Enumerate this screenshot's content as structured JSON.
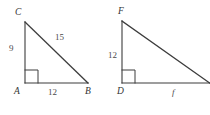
{
  "figure": {
    "background_color": "#ffffff",
    "stroke_color": "#3c3c3c",
    "text_color": "#3a3a3a",
    "triangles": [
      {
        "name": "triangle-abc",
        "vertices": {
          "apex": {
            "label": "C",
            "x": 25,
            "y": 22
          },
          "right_angle": {
            "label": "A",
            "x": 25,
            "y": 83
          },
          "base_end": {
            "label": "B",
            "x": 88,
            "y": 83
          }
        },
        "labels": {
          "apex": "C",
          "right_angle_vertex": "A",
          "base_end_vertex": "B",
          "leg_vertical": "9",
          "leg_horizontal": "12",
          "hypotenuse": "15"
        }
      },
      {
        "name": "triangle-def",
        "vertices": {
          "apex": {
            "label": "F",
            "x": 122,
            "y": 21
          },
          "right_angle": {
            "label": "D",
            "x": 122,
            "y": 83
          },
          "base_end": {
            "label": "",
            "x": 214,
            "y": 83
          }
        },
        "labels": {
          "apex": "F",
          "right_angle_vertex": "D",
          "leg_vertical": "12",
          "leg_horizontal": "f"
        }
      }
    ]
  }
}
